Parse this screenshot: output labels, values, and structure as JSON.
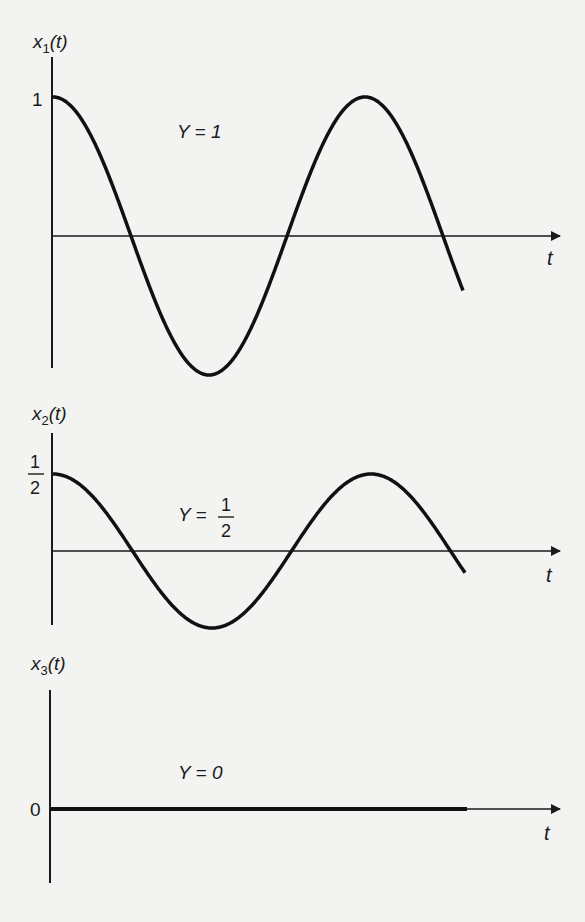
{
  "chart_data": [
    {
      "type": "line",
      "ylabel": "x1(t)",
      "ylabel_main": "x",
      "ylabel_sub": "1",
      "ylabel_suffix": "(t)",
      "xlabel": "t",
      "ytick": "1",
      "annotation": "Y = 1",
      "Y": 1,
      "function": "x1(t) = cos(t)",
      "x": [
        0,
        0.5,
        1,
        1.5,
        2,
        2.5,
        3
      ],
      "values": [
        1,
        0,
        -0.9,
        0,
        1,
        0,
        -0.3
      ],
      "description": "cosine starting at 1, crosses zero, trough near -0.9, peak at 1, crosses zero and continues down"
    },
    {
      "type": "line",
      "ylabel": "x2(t)",
      "ylabel_main": "x",
      "ylabel_sub": "2",
      "ylabel_suffix": "(t)",
      "xlabel": "t",
      "ytick_num": "1",
      "ytick_den": "2",
      "annotation_left": "Y =",
      "annotation_num": "1",
      "annotation_den": "2",
      "Y": 0.5,
      "function": "x2(t) = 0.5 cos(t)",
      "values": [
        0.5,
        0,
        -0.5,
        0,
        0.5,
        0,
        -0.35
      ],
      "description": "cosine starting at 1/2 with half amplitude"
    },
    {
      "type": "line",
      "ylabel": "x3(t)",
      "ylabel_main": "x",
      "ylabel_sub": "3",
      "ylabel_suffix": "(t)",
      "xlabel": "t",
      "ytick": "0",
      "annotation": "Y = 0",
      "Y": 0,
      "function": "x3(t) = 0",
      "values": [
        0,
        0,
        0,
        0,
        0,
        0,
        0
      ],
      "description": "constant zero (thick line along the t axis)"
    }
  ]
}
